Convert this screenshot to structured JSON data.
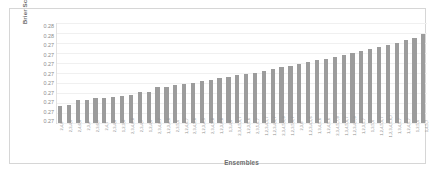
{
  "chart_data": {
    "type": "bar",
    "title": "",
    "subtitle": "",
    "xlabel": "Ensembles",
    "ylabel": "Brier Score",
    "ylim": [
      0.27,
      0.28
    ],
    "ytick_labels": [
      "0.28",
      "0.28",
      "0.27",
      "0.27",
      "0.27",
      "0.27",
      "0.27",
      "0.27",
      "0.27",
      "0.27",
      "0.27"
    ],
    "ytick_values": [
      0.28,
      0.279,
      0.278,
      0.277,
      0.276,
      0.275,
      0.274,
      0.273,
      0.272,
      0.271,
      0.27
    ],
    "grid": true,
    "legend": null,
    "legend_position": "none",
    "bar_color": "#9c9c9c",
    "categories": [
      "2,4,6",
      "2,3,4,6",
      "2,4,6,8",
      "2,3,4",
      "2,3,6,7",
      "2,4,7",
      "2,3,4,8",
      "1,2,3,4",
      "2,3,4,6,8",
      "2,3,4,7",
      "1,2,4,6",
      "2,3,4,6,7",
      "1,2,3,4,6",
      "2,3,5,6",
      "1,2,4,6,7",
      "2,3,4,5,6",
      "1,2,3,4,5",
      "2,3,4,5,8",
      "1,2,3,6,8",
      "1,3,4,6",
      "2,3,4,5,6,7",
      "1,2,3,5,6",
      "2,3,5,6,7",
      "1,2,3,4,5,7",
      "1,2,3,4,6,7",
      "2,3,4,5,6,8",
      "1,2,3,5,6,7",
      "2,3,8",
      "1,2,3,4,5,6",
      "1,3,4,5,6",
      "1,2,4,5,6",
      "2,3,4,5,7,8",
      "1,3,4,5,6,7",
      "1,2,3,4,7,8",
      "1,2,3,5,7",
      "1,3,5,6",
      "1,2,4,5,6,7",
      "1,2,3,4,5,6,7",
      "1,3,4,5,7",
      "1,2,4,5,7",
      "1,2,5,6",
      "1,4,5,7"
    ],
    "values": [
      0.2717,
      0.2718,
      0.2723,
      0.2723,
      0.2725,
      0.2725,
      0.2726,
      0.2727,
      0.2728,
      0.2731,
      0.2731,
      0.2736,
      0.2736,
      0.2738,
      0.2739,
      0.274,
      0.2742,
      0.2743,
      0.2745,
      0.2746,
      0.2748,
      0.275,
      0.2751,
      0.2753,
      0.2755,
      0.2757,
      0.2758,
      0.276,
      0.2762,
      0.2764,
      0.2765,
      0.2767,
      0.2769,
      0.2771,
      0.2773,
      0.2775,
      0.2777,
      0.2779,
      0.2781,
      0.2784,
      0.2786,
      0.279
    ]
  }
}
